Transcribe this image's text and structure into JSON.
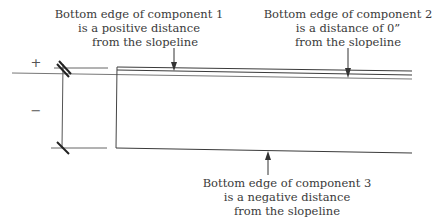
{
  "diagram": {
    "signs": {
      "positive": "+",
      "negative": "−"
    },
    "callouts": [
      {
        "id": "component-1",
        "lines": [
          "Bottom edge of component 1",
          "is a positive distance",
          "from the slopeline"
        ]
      },
      {
        "id": "component-2",
        "lines": [
          "Bottom edge of component 2",
          "is a distance of 0”",
          "from the slopeline"
        ]
      },
      {
        "id": "component-3",
        "lines": [
          "Bottom edge of component 3",
          "is a  negative distance",
          "from the slopeline"
        ]
      }
    ],
    "colors": {
      "line": "#3a3a3a",
      "slope": "#666666",
      "tick": "#222222"
    }
  }
}
